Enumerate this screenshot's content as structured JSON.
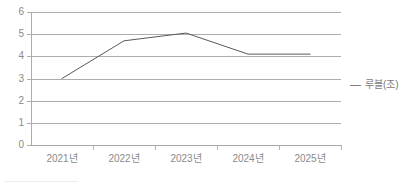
{
  "chart_data": {
    "type": "line",
    "title": "",
    "subtitle": "",
    "xlabel": "",
    "ylabel": "",
    "categories": [
      "2021년",
      "2022년",
      "2023년",
      "2024년",
      "2025년"
    ],
    "series": [
      {
        "name": "루블(조)",
        "values": [
          3.0,
          4.7,
          5.05,
          4.1,
          4.1
        ]
      }
    ],
    "ylim": [
      0,
      6
    ],
    "y_ticks": [
      0,
      1,
      2,
      3,
      4,
      5,
      6
    ],
    "y_tick_labels": [
      "0",
      "1",
      "2",
      "3",
      "4",
      "5",
      "6"
    ],
    "grid": true,
    "grid_axis": "y",
    "legend": {
      "position": "right",
      "entries": [
        {
          "label": "루블(조)",
          "marker": "line-marker",
          "color": "#808080"
        }
      ]
    },
    "colors": {
      "series_line": "#595959",
      "gridline": "#adadad",
      "axis": "#a6a6a6",
      "tick_label": "#8a8a8a",
      "legend_text": "#7a7a7a",
      "background": "#ffffff"
    }
  }
}
